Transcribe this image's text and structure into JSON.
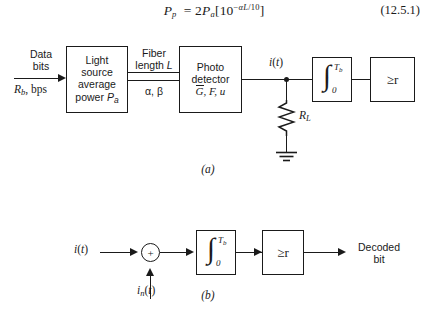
{
  "equation": {
    "number": "(12.5.1)",
    "lhs_var": "P",
    "lhs_sub": "p",
    "rhs_text": "= 2Pa[10^(-αL/10)]",
    "plain": "P_p = 2P_a[10^(-αL/10)]",
    "coefficient": "2",
    "base": "10",
    "exponent": "-αL/10"
  },
  "figure_a": {
    "caption": "(a)",
    "input": {
      "line1": "Data",
      "line2": "bits",
      "rate_label": "Rb, bps"
    },
    "source_block": {
      "line1": "Light",
      "line2": "source",
      "line3": "average",
      "line4": "power Pa"
    },
    "fiber": {
      "above_line1": "Fiber",
      "above_line2": "length L",
      "below": "α, β"
    },
    "detector_block": {
      "line1": "Photo",
      "line2": "detector",
      "line3": "G, F, u"
    },
    "current_label": "i(t)",
    "load_resistor": "RL",
    "integrator": {
      "upper_limit": "Tb",
      "lower_limit": "0",
      "symbol": "∫"
    },
    "comparator": {
      "label": "≥r",
      "threshold": "r"
    }
  },
  "figure_b": {
    "caption": "(b)",
    "input_label": "i(t)",
    "noise_label": "in(t)",
    "sum_sign": "+",
    "integrator": {
      "upper_limit": "Tb",
      "lower_limit": "0",
      "symbol": "∫"
    },
    "comparator": {
      "label": "≥r",
      "threshold": "r"
    },
    "output": {
      "line1": "Decoded",
      "line2": "bit"
    }
  },
  "colors": {
    "ink": "#1a1a1a",
    "paper": "#ffffff"
  }
}
